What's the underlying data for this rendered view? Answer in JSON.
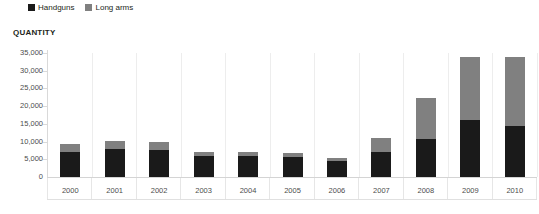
{
  "legend": {
    "position": "top-left",
    "entries": [
      {
        "label": "Handguns",
        "color": "#1a1a1a",
        "icon": "square-swatch"
      },
      {
        "label": "Long arms",
        "color": "#808080",
        "icon": "square-swatch"
      }
    ]
  },
  "axis_title": "QUANTITY",
  "chart_data": {
    "type": "bar",
    "subtype": "stacked-vertical",
    "title": "",
    "subtitle": "",
    "xlabel": "",
    "ylabel": "QUANTITY",
    "categories": [
      "2000",
      "2001",
      "2002",
      "2003",
      "2004",
      "2005",
      "2006",
      "2007",
      "2008",
      "2009",
      "2010"
    ],
    "series": [
      {
        "name": "Handguns",
        "color": "#1a1a1a",
        "values": [
          7000,
          7800,
          7500,
          6000,
          6000,
          5600,
          4400,
          7000,
          10600,
          16000,
          14500
        ]
      },
      {
        "name": "Long arms",
        "color": "#808080",
        "values": [
          2400,
          2500,
          2500,
          1200,
          1200,
          1200,
          1000,
          4100,
          11800,
          18000,
          19500
        ]
      }
    ],
    "totals": [
      9400,
      10300,
      10000,
      7200,
      7200,
      6800,
      5400,
      11100,
      22400,
      34000,
      34000
    ],
    "ylim": [
      0,
      35000
    ],
    "yticks": [
      0,
      5000,
      10000,
      15000,
      20000,
      25000,
      30000,
      35000
    ],
    "ytick_labels": [
      "0",
      "5,000",
      "10,000",
      "15,000",
      "20,000",
      "25,000",
      "30,000",
      "35,000"
    ],
    "grid": "vertical-category-separators",
    "legend_position": "top-left"
  }
}
